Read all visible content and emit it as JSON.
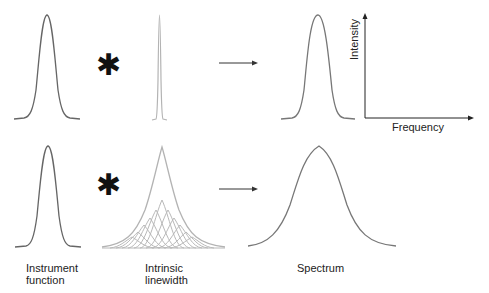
{
  "operators": {
    "convolution": "✱"
  },
  "labels": {
    "instrument_line1": "Instrument",
    "instrument_line2": "function",
    "intrinsic_line1": "Intrinsic",
    "intrinsic_line2": "linewidth",
    "spectrum": "Spectrum"
  },
  "axes": {
    "y_label": "Intensity",
    "x_label": "Frequency"
  },
  "colors": {
    "instrument_curve": "#666666",
    "intrinsic_curve": "#b0b0b0",
    "spectrum_curve": "#777777",
    "arrow": "#333333"
  },
  "rows": [
    {
      "name": "narrow-intrinsic",
      "instrument": "gaussian",
      "intrinsic": "very-narrow",
      "result": "gaussian (instrument-limited)"
    },
    {
      "name": "broad-intrinsic",
      "instrument": "gaussian",
      "intrinsic": "broad (sum of many components)",
      "result": "broadened lineshape"
    }
  ]
}
